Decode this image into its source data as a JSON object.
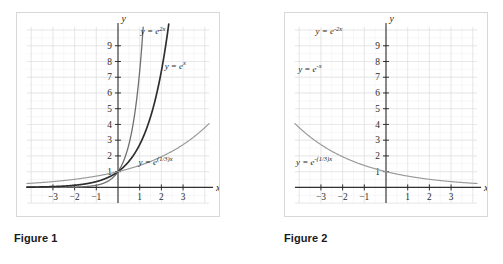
{
  "figures": [
    {
      "id": "figure-1",
      "caption": "Figure 1",
      "axes": {
        "x_name": "x",
        "y_name": "y",
        "x_ticks": [
          "-3",
          "-2",
          "-1",
          "1",
          "2",
          "3"
        ],
        "y_ticks": [
          "1",
          "2",
          "3",
          "4",
          "5",
          "6",
          "7",
          "8",
          "9"
        ],
        "xlim": [
          -4.2,
          4.2
        ],
        "ylim": [
          -1.0,
          10.2
        ]
      },
      "curves": [
        {
          "name": "y-equals-e-2x",
          "label_base": "y = e",
          "label_exp": "2x",
          "label_full": "y = e^{2x}",
          "base": "e",
          "exponent_coefficient": 2,
          "color": "#6e6e6e",
          "stroke_width": 1.3,
          "label_x": 1.05,
          "label_y": 9.75
        },
        {
          "name": "y-equals-e-x",
          "label_base": "y = e",
          "label_exp": "x",
          "label_full": "y = e^{x}",
          "base": "e",
          "exponent_coefficient": 1,
          "color": "#2e2e2e",
          "stroke_width": 1.7,
          "label_x": 2.15,
          "label_y": 7.55
        },
        {
          "name": "y-equals-e-one-third-x",
          "label_base": "y = e",
          "label_exp": "(1/3)x",
          "label_full": "y = e^{(1/3)x}",
          "base": "e",
          "exponent_coefficient": 0.3333,
          "color": "#9a9a9a",
          "stroke_width": 1.2,
          "label_x": 0.95,
          "label_y": 1.45
        }
      ]
    },
    {
      "id": "figure-2",
      "caption": "Figure 2",
      "axes": {
        "x_name": "x",
        "y_name": "y",
        "x_ticks": [
          "-3",
          "-2",
          "-1",
          "1",
          "2",
          "3"
        ],
        "y_ticks": [
          "1",
          "2",
          "3",
          "4",
          "5",
          "6",
          "7",
          "8",
          "9"
        ],
        "xlim": [
          -4.2,
          4.2
        ],
        "ylim": [
          -1.0,
          10.2
        ]
      },
      "curves": [
        {
          "name": "y-equals-e-minus-2x",
          "label_base": "y = e",
          "label_exp": "-2x",
          "label_full": "y = e^{-2x}",
          "base": "e",
          "exponent_coefficient": -2,
          "color": "#6e6e6e",
          "stroke_width": 1.3,
          "label_x": -3.25,
          "label_y": 9.75
        },
        {
          "name": "y-equals-e-minus-x",
          "label_base": "y = e",
          "label_exp": "-x",
          "label_full": "y = e^{-x}",
          "base": "e",
          "exponent_coefficient": -1,
          "color": "#2e2e2e",
          "stroke_width": 1.7,
          "label_x": -4.05,
          "label_y": 7.35
        },
        {
          "name": "y-equals-e-minus-one-third-x",
          "label_base": "y = e",
          "label_exp": "-(1/3)x",
          "label_full": "y = e^{-(1/3)x}",
          "base": "e",
          "exponent_coefficient": -0.3333,
          "color": "#9a9a9a",
          "stroke_width": 1.2,
          "label_x": -4.15,
          "label_y": 1.45
        }
      ]
    }
  ],
  "chart_data": [
    {
      "type": "line",
      "title": "Figure 1",
      "xlabel": "x",
      "ylabel": "y",
      "xlim": [
        -4.2,
        4.2
      ],
      "ylim": [
        -1.0,
        10.2
      ],
      "xticks": [
        -3,
        -2,
        -1,
        1,
        2,
        3
      ],
      "yticks": [
        1,
        2,
        3,
        4,
        5,
        6,
        7,
        8,
        9
      ],
      "grid": true,
      "legend": "inline-annotations",
      "series": [
        {
          "name": "y = e^{2x}",
          "x": [
            -4,
            -3,
            -2,
            -1,
            -0.5,
            0,
            0.5,
            1,
            1.15
          ],
          "values": [
            0.0003,
            0.0025,
            0.0183,
            0.135,
            0.368,
            1,
            2.718,
            7.389,
            9.97
          ]
        },
        {
          "name": "y = e^{x}",
          "x": [
            -4,
            -3,
            -2,
            -1,
            0,
            0.5,
            1,
            1.5,
            2,
            2.3
          ],
          "values": [
            0.018,
            0.05,
            0.135,
            0.368,
            1,
            1.649,
            2.718,
            4.482,
            7.389,
            9.97
          ]
        },
        {
          "name": "y = e^{(1/3)x}",
          "x": [
            -4,
            -3,
            -2,
            -1,
            0,
            1,
            2,
            3,
            4
          ],
          "values": [
            0.264,
            0.368,
            0.513,
            0.717,
            1,
            1.396,
            1.948,
            2.718,
            3.794
          ]
        }
      ]
    },
    {
      "type": "line",
      "title": "Figure 2",
      "xlabel": "x",
      "ylabel": "y",
      "xlim": [
        -4.2,
        4.2
      ],
      "ylim": [
        -1.0,
        10.2
      ],
      "xticks": [
        -3,
        -2,
        -1,
        1,
        2,
        3
      ],
      "yticks": [
        1,
        2,
        3,
        4,
        5,
        6,
        7,
        8,
        9
      ],
      "grid": true,
      "legend": "inline-annotations",
      "series": [
        {
          "name": "y = e^{-2x}",
          "x": [
            -1.15,
            -1,
            -0.5,
            0,
            0.5,
            1,
            2,
            3,
            4
          ],
          "values": [
            9.97,
            7.389,
            2.718,
            1,
            0.368,
            0.135,
            0.0183,
            0.0025,
            0.0003
          ]
        },
        {
          "name": "y = e^{-x}",
          "x": [
            -2.3,
            -2,
            -1.5,
            -1,
            -0.5,
            0,
            1,
            2,
            3,
            4
          ],
          "values": [
            9.97,
            7.389,
            4.482,
            2.718,
            1.649,
            1,
            0.368,
            0.135,
            0.05,
            0.018
          ]
        },
        {
          "name": "y = e^{-(1/3)x}",
          "x": [
            -4,
            -3,
            -2,
            -1,
            0,
            1,
            2,
            3,
            4
          ],
          "values": [
            3.794,
            2.718,
            1.948,
            1.396,
            1,
            0.717,
            0.513,
            0.368,
            0.264
          ]
        }
      ]
    }
  ]
}
